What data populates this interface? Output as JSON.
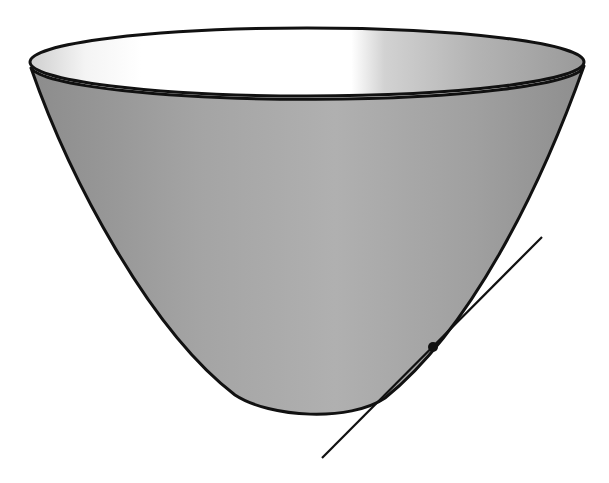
{
  "figure": {
    "colors": {
      "background": "#ffffff",
      "outline": "#111111",
      "surface_dark": "#8a8a8a",
      "surface_mid": "#a6a6a6",
      "surface_light": "#c4c4c4",
      "interior_light": "#ffffff",
      "interior_shade": "#9a9a9a"
    },
    "rim": {
      "cx": 307,
      "cy": 62,
      "rx": 277,
      "ry": 34
    },
    "bottom": {
      "x": 320,
      "y": 416
    },
    "tangent_line": {
      "x1": 322,
      "y1": 458,
      "x2": 542,
      "y2": 237
    },
    "tangent_point": {
      "x": 433,
      "y": 347,
      "r": 5
    }
  }
}
